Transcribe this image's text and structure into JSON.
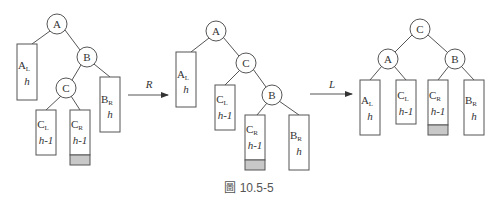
{
  "caption": "圖 10.5-5",
  "colors": {
    "stroke": "#555555",
    "shaded": "#c8c8c8",
    "text": "#333333"
  },
  "arrows": [
    {
      "label": "R"
    },
    {
      "label": "L"
    }
  ],
  "trees": [
    {
      "name": "before",
      "nodes": {
        "root": "A",
        "right": "B",
        "right_left": "C"
      },
      "subtrees": [
        {
          "name": "A",
          "sub": "L",
          "height": "h"
        },
        {
          "name": "B",
          "sub": "R",
          "height": "h"
        },
        {
          "name": "C",
          "sub": "L",
          "height": "h-1"
        },
        {
          "name": "C",
          "sub": "R",
          "height": "h-1",
          "shaded": true
        }
      ]
    },
    {
      "name": "after-R",
      "nodes": {
        "root": "A",
        "right": "C",
        "right_right": "B"
      },
      "subtrees": [
        {
          "name": "A",
          "sub": "L",
          "height": "h"
        },
        {
          "name": "C",
          "sub": "L",
          "height": "h-1"
        },
        {
          "name": "C",
          "sub": "R",
          "height": "h-1",
          "shaded": true
        },
        {
          "name": "B",
          "sub": "R",
          "height": "h"
        }
      ]
    },
    {
      "name": "after-L",
      "nodes": {
        "root": "C",
        "left": "A",
        "right": "B"
      },
      "subtrees": [
        {
          "name": "A",
          "sub": "L",
          "height": "h"
        },
        {
          "name": "C",
          "sub": "L",
          "height": "h-1"
        },
        {
          "name": "C",
          "sub": "R",
          "height": "h-1",
          "shaded": true
        },
        {
          "name": "B",
          "sub": "R",
          "height": "h"
        }
      ]
    }
  ]
}
